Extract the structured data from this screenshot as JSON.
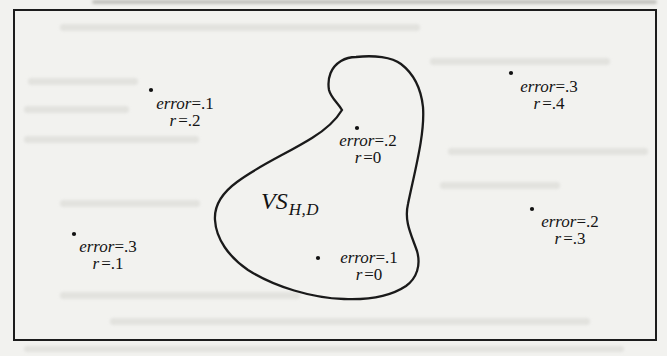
{
  "figure": {
    "region_label": {
      "main": "VS",
      "subscript": "H,D"
    },
    "points": [
      {
        "position": "outer-upper-left",
        "error_var": "error",
        "error_val": "=.1",
        "r_var": "r",
        "r_val": "=.2"
      },
      {
        "position": "outer-upper-right",
        "error_var": "error",
        "error_val": "=.3",
        "r_var": "r",
        "r_val": "=.4"
      },
      {
        "position": "inner-upper",
        "error_var": "error",
        "error_val": "=.2",
        "r_var": "r",
        "r_val": "=0"
      },
      {
        "position": "inner-lower",
        "error_var": "error",
        "error_val": "=.1",
        "r_var": "r",
        "r_val": "=0"
      },
      {
        "position": "outer-lower-left",
        "error_var": "error",
        "error_val": "=.3",
        "r_var": "r",
        "r_val": "=.1"
      },
      {
        "position": "outer-lower-right",
        "error_var": "error",
        "error_val": "=.2",
        "r_var": "r",
        "r_val": "=.3"
      }
    ],
    "colors": {
      "ink": "#1a1a1a",
      "paper": "#f2f2ef"
    }
  }
}
